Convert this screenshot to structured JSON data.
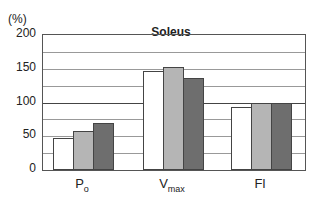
{
  "chart_data": {
    "type": "bar",
    "title": "Soleus",
    "ylabel": "(%)",
    "xlabel": "",
    "categories": [
      "Po",
      "Vmax",
      "Fl"
    ],
    "category_labels": [
      {
        "main": "P",
        "sub": "o"
      },
      {
        "main": "V",
        "sub": "max"
      },
      {
        "main": "Fl",
        "sub": ""
      }
    ],
    "series": [
      {
        "name": "series-1",
        "color": "#ffffff",
        "values": [
          47,
          147,
          93
        ]
      },
      {
        "name": "series-2",
        "color": "#b5b5b5",
        "values": [
          58,
          152,
          100
        ]
      },
      {
        "name": "series-3",
        "color": "#6e6e6e",
        "values": [
          69,
          136,
          100
        ]
      }
    ],
    "ylim": [
      0,
      200
    ],
    "yticks": [
      0,
      50,
      100,
      150,
      200
    ],
    "minor_gridlines": [
      25,
      75,
      125,
      175
    ],
    "reference_line": 100,
    "grid": true,
    "legend": "none"
  }
}
